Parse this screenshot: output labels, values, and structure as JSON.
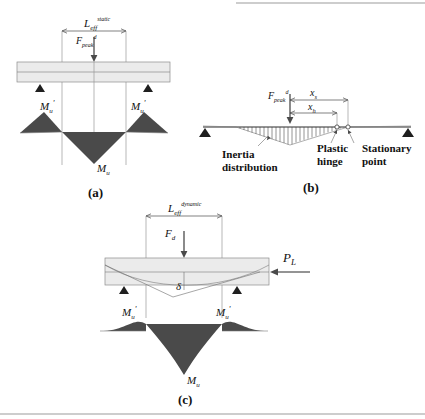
{
  "figure": {
    "type": "engineering-diagram",
    "panels": [
      {
        "tag": "(a)",
        "name": "static",
        "span_label_main": "L",
        "span_label_sub": "eff",
        "span_label_sup": "static",
        "force_label_main": "F",
        "force_label_sub": "peak",
        "force_label_sup": "d",
        "moment_left": "M",
        "moment_left_sub": "u",
        "moment_left_prime": "'",
        "moment_right": "M",
        "moment_right_sub": "u",
        "moment_right_prime": "'",
        "moment_center": "M",
        "moment_center_sub": "u"
      },
      {
        "tag": "(b)",
        "name": "inertia",
        "force_label_main": "F",
        "force_label_sub": "peak",
        "force_label_sup": "d",
        "dim_outer_main": "x",
        "dim_outer_sub": "s",
        "dim_inner_main": "x",
        "dim_inner_sub": "h",
        "annotation_inertia_line1": "Inertia",
        "annotation_inertia_line2": "distribution",
        "annotation_hinge_line1": "Plastic",
        "annotation_hinge_line2": "hinge",
        "annotation_stationary_line1": "Stationary",
        "annotation_stationary_line2": "point"
      },
      {
        "tag": "(c)",
        "name": "dynamic",
        "span_label_main": "L",
        "span_label_sub": "eff",
        "span_label_sup": "dynamic",
        "force_label_main": "F",
        "force_label_sub": "d",
        "axial_label_main": "P",
        "axial_label_sub": "L",
        "deflection_label": "δ",
        "moment_left": "M",
        "moment_left_sub": "u",
        "moment_left_prime": "'",
        "moment_right": "M",
        "moment_right_sub": "u",
        "moment_right_prime": "'",
        "moment_center": "M",
        "moment_center_sub": "u"
      }
    ],
    "colors": {
      "moment_fill": "#4a4a4a",
      "beam_fill": "#ebebeb",
      "beam_stroke": "#8c8c8c",
      "line": "#2b2b2b",
      "guide": "#9a9a9a",
      "text": "#111111"
    }
  }
}
